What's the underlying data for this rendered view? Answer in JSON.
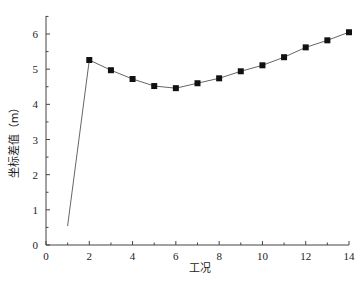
{
  "chart_data": {
    "type": "line",
    "title": "",
    "xlabel": "工况",
    "ylabel": "坐标差值（m）",
    "xlim": [
      0,
      14
    ],
    "ylim": [
      0,
      6.5
    ],
    "xticks": [
      0,
      2,
      4,
      6,
      8,
      10,
      12,
      14
    ],
    "yticks": [
      0,
      1,
      2,
      3,
      4,
      5,
      6
    ],
    "grid": false,
    "legend": null,
    "series": [
      {
        "name": "坐标差值",
        "marker": "square",
        "marker_start_index": 1,
        "x": [
          1,
          2,
          3,
          4,
          5,
          6,
          7,
          8,
          9,
          10,
          11,
          12,
          13,
          14
        ],
        "values": [
          0.54,
          5.26,
          4.97,
          4.72,
          4.52,
          4.46,
          4.6,
          4.74,
          4.94,
          5.11,
          5.34,
          5.62,
          5.82,
          6.05
        ]
      }
    ]
  },
  "colors": {
    "axis": "#444444",
    "line": "#666666",
    "marker": "#111111",
    "text": "#222222"
  }
}
